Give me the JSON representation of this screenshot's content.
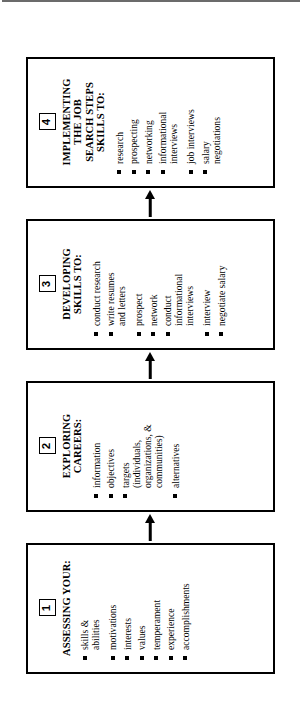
{
  "document": {
    "title": "Career Development and Job Search Process",
    "orientation": "rotated-90-ccw",
    "background_color": "#ffffff",
    "ink_color": "#000000"
  },
  "flowchart": {
    "type": "linear-process",
    "direction": "left-to-right",
    "connector_icon": "right-arrow-icon",
    "bullet_icon": "filled-square-bullet",
    "steps": [
      {
        "number": "1",
        "title": "ASSESSING YOUR:",
        "items": [
          {
            "text": "skills &\nabilities",
            "gap_before": false
          },
          {
            "text": "motivations",
            "gap_before": true
          },
          {
            "text": "interests",
            "gap_before": false
          },
          {
            "text": "values",
            "gap_before": false
          },
          {
            "text": "temperament",
            "gap_before": false
          },
          {
            "text": "experience",
            "gap_before": false
          },
          {
            "text": "accomplishments",
            "gap_before": false
          }
        ]
      },
      {
        "number": "2",
        "title": "EXPLORING\nCAREERS:",
        "items": [
          {
            "text": "information",
            "gap_before": false
          },
          {
            "text": "objectives",
            "gap_before": false
          },
          {
            "text": "targets\n(individuals,\norganizations, &\ncommunities)",
            "gap_before": false
          },
          {
            "text": "alternatives",
            "gap_before": true
          }
        ]
      },
      {
        "number": "3",
        "title": "DEVELOPING\nSKILLS TO:",
        "items": [
          {
            "text": "conduct research",
            "gap_before": false
          },
          {
            "text": "write resumes\nand letters",
            "gap_before": false
          },
          {
            "text": "prospect",
            "gap_before": true
          },
          {
            "text": "network",
            "gap_before": false
          },
          {
            "text": "conduct\ninformational\ninterviews",
            "gap_before": false
          },
          {
            "text": "interview",
            "gap_before": true
          },
          {
            "text": "negotiate salary",
            "gap_before": false
          }
        ]
      },
      {
        "number": "4",
        "title": "IMPLEMENTING\nTHE JOB\nSEARCH STEPS\nSKILLS TO:",
        "items": [
          {
            "text": "research",
            "gap_before": false
          },
          {
            "text": "prospecting",
            "gap_before": false
          },
          {
            "text": "networking",
            "gap_before": false
          },
          {
            "text": "informational\ninterviews",
            "gap_before": false
          },
          {
            "text": "job interviews",
            "gap_before": true
          },
          {
            "text": "salary\nnegotiations",
            "gap_before": false
          }
        ]
      }
    ]
  }
}
